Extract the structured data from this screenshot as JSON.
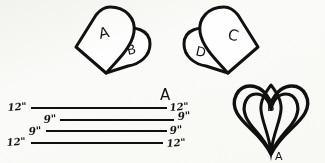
{
  "page": {
    "background_color": "#fbfbf9",
    "ink_color": "#111111"
  },
  "figures": [
    {
      "id": "fig-ab",
      "name": "petal-pair-ab",
      "description": "Large rounded petal pattern piece overlapped by a smaller rounded piece",
      "labels": {
        "large": "A",
        "small": "B"
      }
    },
    {
      "id": "fig-cd",
      "name": "petal-pair-cd",
      "description": "Mirrored large rounded petal pattern piece overlapped by a smaller rounded piece",
      "labels": {
        "large": "C",
        "small": "D"
      }
    },
    {
      "id": "fig-lines",
      "name": "measured-strips",
      "description": "Four stacked horizontal strips with inch measurements at each end",
      "piece_label": "A",
      "strips": [
        {
          "left_label": "12\"",
          "right_label": "12\""
        },
        {
          "left_label": "9\"",
          "right_label": "9\""
        },
        {
          "left_label": "9\"",
          "right_label": "9\""
        },
        {
          "left_label": "12\"",
          "right_label": "12\""
        }
      ]
    },
    {
      "id": "fig-heart",
      "name": "nested-heart",
      "description": "Nested heart outlines tapering to a point at the bottom",
      "labels": {
        "inner": "B",
        "point": "A"
      }
    }
  ]
}
